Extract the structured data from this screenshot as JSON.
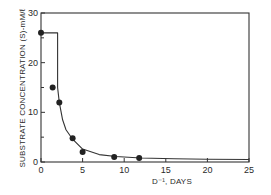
{
  "chart_data": {
    "type": "scatter",
    "title": "",
    "xlabel": "D⁻¹, DAYS",
    "ylabel": "SUBSTRATE CONCENTRATION (S)-mM/ℓ",
    "xlim": [
      0,
      25
    ],
    "ylim": [
      0,
      30
    ],
    "x_ticks": [
      "0",
      "5",
      "10",
      "15",
      "20",
      "25"
    ],
    "y_ticks": [
      "0",
      "10",
      "20",
      "30"
    ],
    "grid": false,
    "legend": "none",
    "series": [
      {
        "name": "measured",
        "kind": "points",
        "x": [
          0,
          1.4,
          2.2,
          3.8,
          5.0,
          8.8,
          11.8
        ],
        "y": [
          26,
          15,
          12,
          4.8,
          2.0,
          1.0,
          0.8
        ]
      },
      {
        "name": "fitted curve",
        "kind": "line",
        "description": "horizontal at S=26 from D⁻¹=0 to ~2, then hyperbolic decay toward ~0.5",
        "x": [
          0,
          2.0,
          2.0,
          2.2,
          2.6,
          3.0,
          3.8,
          5.0,
          7.0,
          9.0,
          12.0,
          16.0,
          20.0,
          25.0
        ],
        "y": [
          26,
          26,
          15,
          12,
          8.5,
          6.5,
          4.6,
          2.6,
          1.5,
          1.1,
          0.8,
          0.65,
          0.55,
          0.5
        ]
      }
    ]
  },
  "labels": {
    "xlabel": "D⁻¹, DAYS",
    "ylabel": "SUBSTRATE CONCENTRATION (S)-mM/ℓ"
  }
}
